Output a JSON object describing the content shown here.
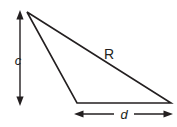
{
  "figure": {
    "type": "geometry-diagram",
    "background_color": "#ffffff",
    "stroke_color": "#231f20",
    "canvas": {
      "width": 177,
      "height": 127
    },
    "shape": {
      "name": "triangle",
      "stroke_width": 1.6,
      "fill": "none",
      "vertices": [
        {
          "name": "apex",
          "x": 27,
          "y": 12
        },
        {
          "name": "bottom-left",
          "x": 77,
          "y": 103
        },
        {
          "name": "bottom-right",
          "x": 171,
          "y": 103
        }
      ]
    },
    "edge_labels": [
      {
        "id": "hypotenuse",
        "text": "R",
        "style": "upright",
        "font_size": 14,
        "x": 109,
        "y": 59
      }
    ],
    "dimensions": [
      {
        "id": "vertical-dimension",
        "label": "c",
        "style": "italic",
        "font_size": 13,
        "orientation": "vertical",
        "x": 20,
        "y_start": 11,
        "y_end": 105,
        "label_x": 18,
        "label_y": 65,
        "arrowheads": "both",
        "stroke_width": 1.4
      },
      {
        "id": "horizontal-dimension",
        "label": "d",
        "style": "italic",
        "font_size": 13,
        "orientation": "horizontal",
        "y": 114,
        "x_start": 75,
        "x_end": 172,
        "label_x": 124,
        "label_y": 119,
        "arrowheads": "both",
        "stroke_width": 1.4
      }
    ]
  }
}
